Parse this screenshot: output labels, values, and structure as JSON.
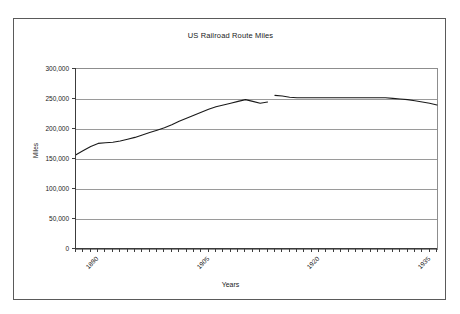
{
  "chart_data": {
    "type": "line",
    "title": "US Railroad Route Miles",
    "xlabel": "Years",
    "ylabel": "Miles",
    "xlim": [
      1890,
      1939
    ],
    "ylim": [
      0,
      300000
    ],
    "ytick_labels": [
      "300,000",
      "250,000",
      "200,000",
      "150,000",
      "100,000",
      "50,000",
      "0"
    ],
    "ytick_values": [
      300000,
      250000,
      200000,
      150000,
      100000,
      50000,
      0
    ],
    "xtick_labels": [
      "1890",
      "1905",
      "1920",
      "1935"
    ],
    "xtick_values": [
      1890,
      1905,
      1920,
      1935
    ],
    "xtick_interval_years": 1,
    "grid": "horizontal",
    "legend": "none",
    "line_color": "#1a1a1a",
    "series": [
      {
        "name": "US Railroad Route Miles",
        "x": [
          1890,
          1891,
          1892,
          1893,
          1894,
          1895,
          1896,
          1897,
          1898,
          1899,
          1900,
          1901,
          1902,
          1903,
          1904,
          1905,
          1906,
          1907,
          1908,
          1909,
          1910,
          1911,
          1912,
          1913,
          1914,
          1915,
          1916
        ],
        "values": [
          157000,
          164000,
          171000,
          176000,
          177000,
          178000,
          180000,
          183000,
          186000,
          190000,
          194000,
          198000,
          202000,
          207000,
          213000,
          218000,
          223000,
          228000,
          233000,
          237000,
          240000,
          243000,
          246000,
          249000,
          246000,
          243000,
          245000
        ]
      },
      {
        "name": "US Railroad Route Miles (revised series)",
        "x": [
          1917,
          1918,
          1919,
          1920,
          1921,
          1922,
          1923,
          1924,
          1925,
          1926,
          1927,
          1928,
          1929,
          1930,
          1931,
          1932,
          1933,
          1934,
          1935,
          1936,
          1937,
          1938,
          1939
        ],
        "values": [
          256000,
          255000,
          253000,
          252000,
          252000,
          252000,
          252000,
          252000,
          252000,
          252000,
          252000,
          252000,
          252000,
          252000,
          252000,
          252000,
          251000,
          250000,
          249000,
          247000,
          245000,
          243000,
          240000
        ]
      }
    ]
  },
  "figure": {
    "title": "US Railroad Route Miles",
    "x_axis_title": "Years",
    "y_axis_title": "Miles"
  }
}
